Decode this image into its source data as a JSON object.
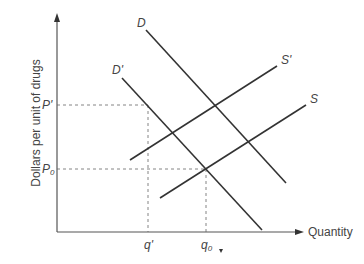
{
  "diagram": {
    "type": "supply-demand",
    "y_axis_label": "Dollars per unit of drugs",
    "x_axis_label": "Quantity",
    "curves": [
      {
        "id": "D",
        "label": "D",
        "kind": "demand"
      },
      {
        "id": "Dprime",
        "label": "D'",
        "kind": "demand"
      },
      {
        "id": "Sprime",
        "label": "S'",
        "kind": "supply"
      },
      {
        "id": "S",
        "label": "S",
        "kind": "supply"
      }
    ],
    "price_levels": [
      {
        "id": "Pprime",
        "label": "P'",
        "sub": ""
      },
      {
        "id": "P0",
        "label": "P",
        "sub": "0"
      }
    ],
    "quantity_levels": [
      {
        "id": "qprime",
        "label": "q'",
        "sub": ""
      },
      {
        "id": "q0",
        "label": "q",
        "sub": "0"
      }
    ],
    "equilibria": [
      {
        "name": "original",
        "curves": [
          "D'",
          "S"
        ],
        "price": "P0",
        "quantity": "q0"
      },
      {
        "name": "shifted",
        "curves": [
          "D'",
          "S'"
        ],
        "price": "P'",
        "quantity": "q'"
      }
    ]
  }
}
